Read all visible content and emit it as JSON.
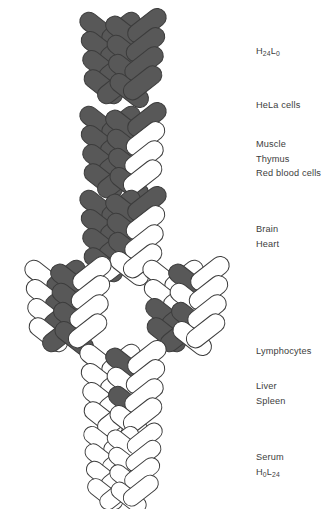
{
  "figure": {
    "background_color": "#ffffff",
    "subunit_dark_color": "#585858",
    "subunit_light_color": "#ffffff",
    "subunit_outline_color": "#3c3c3c",
    "text_color": "#3d3d3d",
    "total_subunits": 24,
    "visible_subunits_per_molecule": 16
  },
  "molecules": [
    {
      "id": "molecule-h24l0",
      "row": 1,
      "x": 75,
      "y": 14,
      "width": 96,
      "height": 88,
      "dark_count": 16,
      "light_count": 0,
      "dark_indices": [
        0,
        1,
        2,
        3,
        4,
        5,
        6,
        7,
        8,
        9,
        10,
        11,
        12,
        13,
        14,
        15
      ],
      "composition": "H24L0",
      "description": "all dark subunits"
    },
    {
      "id": "molecule-hela",
      "row": 2,
      "x": 75,
      "y": 108,
      "width": 96,
      "height": 88,
      "dark_count": 13,
      "light_count": 3,
      "dark_indices": [
        0,
        1,
        2,
        3,
        4,
        5,
        6,
        7,
        8,
        9,
        10,
        12,
        14
      ],
      "composition": "H-rich",
      "description": "mostly dark, three light subunits on right"
    },
    {
      "id": "molecule-muscle-thymus-rbc",
      "row": 3,
      "x": 75,
      "y": 192,
      "width": 96,
      "height": 88,
      "dark_count": 11,
      "light_count": 5,
      "dark_indices": [
        0,
        1,
        2,
        3,
        4,
        5,
        6,
        8,
        9,
        10,
        12
      ],
      "composition": "H-dominant",
      "description": "dark left, light cluster on right"
    },
    {
      "id": "molecule-brain-left",
      "row": 4,
      "x": 20,
      "y": 262,
      "width": 96,
      "height": 88,
      "dark_count": 8,
      "light_count": 8,
      "dark_indices": [
        1,
        3,
        5,
        7,
        8,
        10,
        12,
        14
      ],
      "composition": "H/L mixed",
      "description": "approximately half dark, half light"
    },
    {
      "id": "molecule-heart-right",
      "row": 4,
      "x": 138,
      "y": 262,
      "width": 96,
      "height": 88,
      "dark_count": 6,
      "light_count": 10,
      "dark_indices": [
        4,
        5,
        6,
        7,
        8,
        12
      ],
      "composition": "L-leaning",
      "description": "dark subunits on lower left, light elsewhere"
    },
    {
      "id": "molecule-liver-spleen",
      "row": 5,
      "x": 75,
      "y": 346,
      "width": 96,
      "height": 88,
      "dark_count": 2,
      "light_count": 14,
      "dark_indices": [
        8,
        12
      ],
      "composition": "L-rich",
      "description": "almost all light, two dark subunits at bottom centre"
    },
    {
      "id": "molecule-h0l24",
      "row": 6,
      "x": 75,
      "y": 428,
      "width": 96,
      "height": 80,
      "dark_count": 0,
      "light_count": 16,
      "dark_indices": [],
      "composition": "H0L24",
      "description": "all light subunits"
    }
  ],
  "labels": [
    {
      "id": "label-h24l0",
      "y": 44,
      "lines": [
        {
          "pre": "H",
          "sub1": "24",
          "mid": "L",
          "sub2": "0",
          "formula": true
        }
      ]
    },
    {
      "id": "label-hela",
      "y": 98,
      "lines": [
        {
          "text": "HeLa cells"
        }
      ]
    },
    {
      "id": "label-muscle-thymus-rbc",
      "y": 137,
      "lines": [
        {
          "text": "Muscle"
        },
        {
          "text": "Thymus"
        },
        {
          "text": "Red blood cells"
        }
      ]
    },
    {
      "id": "label-brain-heart",
      "y": 222,
      "lines": [
        {
          "text": "Brain"
        },
        {
          "text": "Heart"
        }
      ]
    },
    {
      "id": "label-lymphocytes",
      "y": 344,
      "lines": [
        {
          "text": "Lymphocytes"
        }
      ]
    },
    {
      "id": "label-liver-spleen",
      "y": 379,
      "lines": [
        {
          "text": "Liver"
        },
        {
          "text": "Spleen"
        }
      ]
    },
    {
      "id": "label-serum",
      "y": 450,
      "lines": [
        {
          "text": "Serum"
        },
        {
          "pre": "H",
          "sub1": "0",
          "mid": "L",
          "sub2": "24",
          "formula": true
        }
      ]
    }
  ]
}
